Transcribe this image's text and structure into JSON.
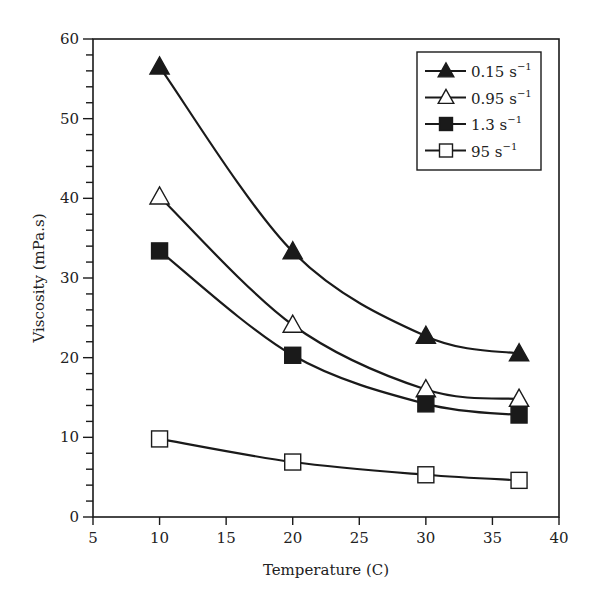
{
  "chart_data": {
    "type": "line",
    "title": "",
    "xlabel": "Temperature (C)",
    "ylabel": "Viscosity (mPa.s)",
    "xlim": [
      5,
      40
    ],
    "ylim": [
      0,
      60
    ],
    "x_ticks": [
      5,
      10,
      15,
      20,
      25,
      30,
      35,
      40
    ],
    "y_ticks": [
      0,
      10,
      20,
      30,
      40,
      50,
      60
    ],
    "y_minor_step": 2,
    "grid": false,
    "legend_position": "upper right",
    "x": [
      10,
      20,
      30,
      37
    ],
    "series": [
      {
        "name": "0.15 s⁻¹",
        "base": "0.15 s",
        "sup": "−1",
        "marker": "filled-triangle",
        "values": [
          56.5,
          33.3,
          22.7,
          20.5
        ]
      },
      {
        "name": "0.95 s⁻¹",
        "base": "0.95 s",
        "sup": "−1",
        "marker": "open-triangle",
        "values": [
          40.2,
          24.1,
          16.0,
          14.8
        ]
      },
      {
        "name": "1.3 s⁻¹",
        "base": "1.3 s",
        "sup": "−1",
        "marker": "filled-square",
        "values": [
          33.4,
          20.3,
          14.2,
          12.8
        ]
      },
      {
        "name": "95 s⁻¹",
        "base": "95 s",
        "sup": "−1",
        "marker": "open-square",
        "values": [
          9.8,
          6.9,
          5.3,
          4.6
        ]
      }
    ]
  },
  "colors": {
    "line": "#1a1a1a",
    "background": "#ffffff"
  }
}
